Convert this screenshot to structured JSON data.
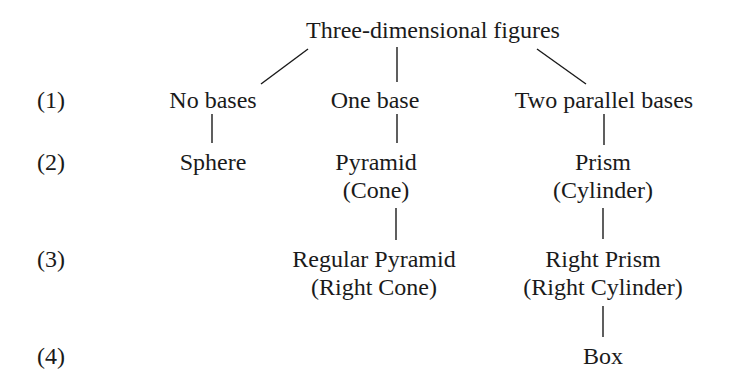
{
  "title": "Three-dimensional figures",
  "levels": [
    "(1)",
    "(2)",
    "(3)",
    "(4)"
  ],
  "nodes": {
    "no_bases": "No bases",
    "one_base": "One base",
    "two_parallel_bases": "Two parallel bases",
    "sphere": "Sphere",
    "pyramid": "Pyramid",
    "cone": "(Cone)",
    "prism": "Prism",
    "cylinder": "(Cylinder)",
    "regular_pyramid": "Regular Pyramid",
    "right_cone": "(Right Cone)",
    "right_prism": "Right Prism",
    "right_cylinder": "(Right Cylinder)",
    "box": "Box"
  }
}
